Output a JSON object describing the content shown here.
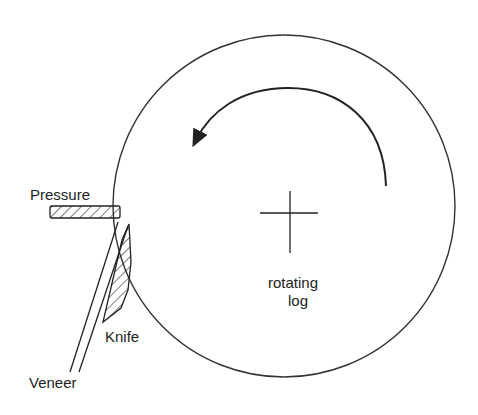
{
  "diagram": {
    "labels": {
      "pressure": "Pressure",
      "knife": "Knife",
      "veneer": "Veneer",
      "log_line1": "rotating",
      "log_line2": "log"
    },
    "rotation_direction": "counter-clockwise",
    "colors": {
      "stroke": "#222222",
      "background": "#ffffff"
    }
  }
}
